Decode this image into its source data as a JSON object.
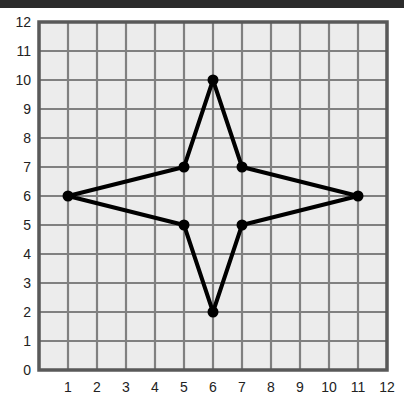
{
  "figure": {
    "background_color": "#ffffff",
    "top_band_color": "#2b2b2b",
    "plot_background_color": "#ececec",
    "grid_color": "#808080",
    "frame_color": "#595959",
    "series_color": "#000000",
    "tick_label_color": "#222222"
  },
  "chart_data": {
    "type": "scatter",
    "title": "",
    "subtitle": "",
    "xlabel": "",
    "ylabel": "",
    "xlim": [
      0,
      12
    ],
    "ylim": [
      0,
      12
    ],
    "grid": true,
    "legend": false,
    "legend_position": "none",
    "x_tick_labels": [
      "1",
      "2",
      "3",
      "4",
      "5",
      "6",
      "7",
      "8",
      "9",
      "10",
      "11",
      "12"
    ],
    "x_ticks": [
      1,
      2,
      3,
      4,
      5,
      6,
      7,
      8,
      9,
      10,
      11,
      12
    ],
    "y_tick_labels": [
      "0",
      "1",
      "2",
      "3",
      "4",
      "5",
      "6",
      "7",
      "8",
      "9",
      "10",
      "11",
      "12"
    ],
    "y_ticks": [
      0,
      1,
      2,
      3,
      4,
      5,
      6,
      7,
      8,
      9,
      10,
      11,
      12
    ],
    "closed_shape": true,
    "marker": "circle",
    "marker_size": 11,
    "line_width": 4,
    "points": [
      {
        "label": "A",
        "x": 1,
        "y": 6
      },
      {
        "label": "B",
        "x": 5,
        "y": 7
      },
      {
        "label": "C",
        "x": 6,
        "y": 10
      },
      {
        "label": "D",
        "x": 7,
        "y": 7
      },
      {
        "label": "E",
        "x": 11,
        "y": 6
      },
      {
        "label": "F",
        "x": 7,
        "y": 5
      },
      {
        "label": "G",
        "x": 6,
        "y": 2
      },
      {
        "label": "H",
        "x": 5,
        "y": 5
      }
    ],
    "x": [
      1,
      5,
      6,
      7,
      11,
      7,
      6,
      5
    ],
    "values": [
      6,
      7,
      10,
      7,
      6,
      5,
      2,
      5
    ]
  }
}
